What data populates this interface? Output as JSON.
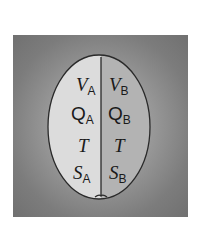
{
  "diagram": {
    "colors": {
      "background_box": "#7c7c7c",
      "subsystem_a_fill": "#dedede",
      "subsystem_b_fill": "#b0b0b0",
      "outline": "#2a2a2a"
    },
    "subsystem_a": {
      "rows": [
        {
          "symbol": "V",
          "subscript": "A"
        },
        {
          "symbol": "Q",
          "subscript": "A"
        },
        {
          "symbol": "T",
          "subscript": ""
        },
        {
          "symbol": "S",
          "subscript": "A"
        }
      ]
    },
    "subsystem_b": {
      "rows": [
        {
          "symbol": "V",
          "subscript": "B"
        },
        {
          "symbol": "Q",
          "subscript": "B"
        },
        {
          "symbol": "T",
          "subscript": ""
        },
        {
          "symbol": "S",
          "subscript": "B"
        }
      ]
    }
  }
}
